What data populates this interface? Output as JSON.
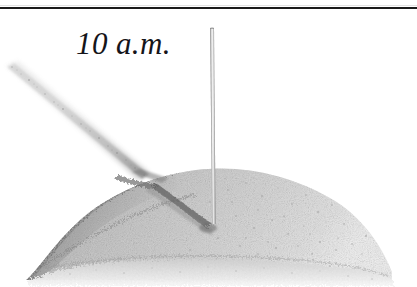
{
  "figure": {
    "caption": "10 a.m.",
    "background_color": "#ffffff"
  },
  "rule": {
    "color": "#1a1a1a"
  },
  "scene": {
    "gnomon_label": "gnomon-stick",
    "mound_label": "sand-mound",
    "shadow_label": "stick-shadow",
    "colors": {
      "sand_light": "#d9d9d9",
      "sand_mid": "#b4b4b4",
      "sand_dark": "#8a8a8a",
      "sand_shade": "#6f6f6f",
      "shadow": "#7b7b7b",
      "stick": "#cfcfcf",
      "stick_edge": "#9a9a9a",
      "ink": "#15151a"
    }
  }
}
